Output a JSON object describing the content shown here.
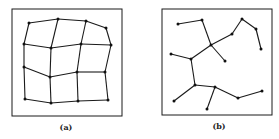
{
  "panels": [
    {
      "id": "a",
      "label": "(a)",
      "description": "distorted 4x4 grid mesh",
      "box": {
        "x": 12,
        "y": 9,
        "w": 110,
        "h": 107
      },
      "label_pos": {
        "x": 66,
        "y": 123
      },
      "nodes": [
        [
          29,
          23
        ],
        [
          58,
          19
        ],
        [
          86,
          21
        ],
        [
          106,
          28
        ],
        [
          24,
          44
        ],
        [
          51,
          48
        ],
        [
          81,
          44
        ],
        [
          111,
          45
        ],
        [
          24,
          67
        ],
        [
          50,
          77
        ],
        [
          77,
          72
        ],
        [
          105,
          72
        ],
        [
          25,
          99
        ],
        [
          51,
          103
        ],
        [
          78,
          101
        ],
        [
          108,
          100
        ]
      ],
      "edges": [
        [
          0,
          1
        ],
        [
          1,
          2
        ],
        [
          2,
          3
        ],
        [
          4,
          5
        ],
        [
          5,
          6
        ],
        [
          6,
          7
        ],
        [
          8,
          9
        ],
        [
          9,
          10
        ],
        [
          10,
          11
        ],
        [
          12,
          13
        ],
        [
          13,
          14
        ],
        [
          14,
          15
        ],
        [
          0,
          4
        ],
        [
          4,
          8
        ],
        [
          8,
          12
        ],
        [
          1,
          5
        ],
        [
          5,
          9
        ],
        [
          9,
          13
        ],
        [
          2,
          6
        ],
        [
          6,
          10
        ],
        [
          10,
          14
        ],
        [
          3,
          7
        ],
        [
          7,
          11
        ],
        [
          11,
          15
        ]
      ]
    },
    {
      "id": "b",
      "label": "(b)",
      "description": "spanning tree graph",
      "box": {
        "x": 162,
        "y": 9,
        "w": 110,
        "h": 106
      },
      "label_pos": {
        "x": 219,
        "y": 122
      },
      "nodes": [
        [
          178,
          24
        ],
        [
          202,
          20
        ],
        [
          211,
          45
        ],
        [
          225,
          61
        ],
        [
          232,
          34
        ],
        [
          242,
          19
        ],
        [
          256,
          29
        ],
        [
          261,
          49
        ],
        [
          171,
          54
        ],
        [
          191,
          59
        ],
        [
          195,
          85
        ],
        [
          174,
          101
        ],
        [
          215,
          87
        ],
        [
          207,
          109
        ],
        [
          238,
          98
        ],
        [
          262,
          91
        ]
      ],
      "edges": [
        [
          0,
          1
        ],
        [
          1,
          2
        ],
        [
          2,
          3
        ],
        [
          2,
          4
        ],
        [
          4,
          5
        ],
        [
          5,
          6
        ],
        [
          6,
          7
        ],
        [
          2,
          9
        ],
        [
          8,
          9
        ],
        [
          9,
          10
        ],
        [
          10,
          11
        ],
        [
          10,
          12
        ],
        [
          12,
          13
        ],
        [
          12,
          14
        ],
        [
          14,
          15
        ]
      ]
    }
  ],
  "colors": {
    "stroke": "#1a1a1a",
    "node": "#111111",
    "background": "#ffffff"
  }
}
